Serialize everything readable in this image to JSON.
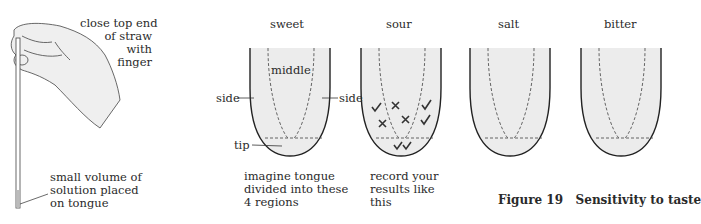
{
  "figure": {
    "number_label": "Figure 19",
    "title": "Sensitivity to taste"
  },
  "hand_diagram": {
    "top_label": [
      "close top end",
      "of straw",
      "with",
      "finger"
    ],
    "bottom_label": [
      "small volume of",
      "solution placed",
      "on tongue"
    ]
  },
  "tongues": [
    {
      "taste": "sweet",
      "labels": {
        "middle": "middle",
        "side_left": "side",
        "side_right": "side",
        "tip": "tip"
      }
    },
    {
      "taste": "sour"
    },
    {
      "taste": "salt"
    },
    {
      "taste": "bitter"
    }
  ],
  "notes": {
    "sweet": [
      "imagine tongue",
      "divided into these",
      "4 regions"
    ],
    "sour": [
      "record your",
      "results like",
      "this"
    ]
  },
  "sour_marks": [
    {
      "type": "tick",
      "region": "left-side"
    },
    {
      "type": "cross",
      "region": "middle"
    },
    {
      "type": "cross",
      "region": "left-side"
    },
    {
      "type": "cross",
      "region": "middle"
    },
    {
      "type": "tick",
      "region": "right-side"
    },
    {
      "type": "tick",
      "region": "right-side"
    },
    {
      "type": "tick",
      "region": "tip"
    },
    {
      "type": "tick",
      "region": "tip"
    }
  ],
  "colors": {
    "tongue_fill": "#ececec",
    "ink": "#222222"
  }
}
